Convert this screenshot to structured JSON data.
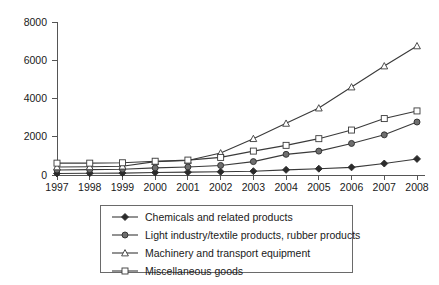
{
  "chart_data": {
    "type": "line",
    "title": "",
    "subtitle": "",
    "xlabel": "",
    "ylabel": "",
    "x": [
      1997,
      1998,
      1999,
      2000,
      2001,
      2002,
      2003,
      2004,
      2005,
      2006,
      2007,
      2008
    ],
    "categories": [
      "1997",
      "1998",
      "1999",
      "2000",
      "2001",
      "2002",
      "2003",
      "2004",
      "2005",
      "2006",
      "2007",
      "2008"
    ],
    "xlim": [
      1997,
      2008
    ],
    "ylim": [
      0,
      8000
    ],
    "ytick_labels": [
      "0",
      "2000",
      "4000",
      "6000",
      "8000"
    ],
    "ytick_values": [
      0,
      2000,
      4000,
      6000,
      8000
    ],
    "grid": false,
    "legend_position": "below",
    "series": [
      {
        "name": "Chemicals and related products",
        "marker": "diamond-filled",
        "color": "#2b2b2b",
        "values": [
          80,
          90,
          100,
          130,
          150,
          170,
          200,
          270,
          330,
          400,
          600,
          840
        ]
      },
      {
        "name": "Light industry/textile products, rubber products",
        "marker": "circle-filled",
        "color": "#6e6e6e",
        "values": [
          260,
          280,
          300,
          370,
          420,
          500,
          700,
          1080,
          1250,
          1650,
          2100,
          2770
        ]
      },
      {
        "name": "Machinery and transport equipment",
        "marker": "triangle-open",
        "color": "#3a3a3a",
        "values": [
          420,
          430,
          460,
          700,
          760,
          1150,
          1900,
          2700,
          3500,
          4600,
          5700,
          6750
        ]
      },
      {
        "name": "Miscellaneous goods",
        "marker": "square-open",
        "color": "#3a3a3a",
        "values": [
          620,
          620,
          640,
          720,
          780,
          920,
          1250,
          1550,
          1900,
          2350,
          2950,
          3350
        ]
      }
    ]
  },
  "legend": {
    "items": [
      {
        "label": "Chemicals and related products",
        "marker": "diamond-filled"
      },
      {
        "label": "Light industry/textile products, rubber products",
        "marker": "circle-filled"
      },
      {
        "label": "Machinery and transport equipment",
        "marker": "triangle-open"
      },
      {
        "label": "Miscellaneous goods",
        "marker": "square-open"
      }
    ]
  }
}
